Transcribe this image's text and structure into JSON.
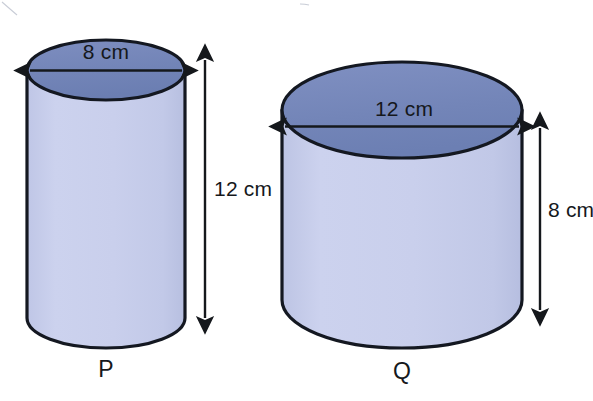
{
  "figure": {
    "background_color": "#ffffff",
    "outline_color": "#141821",
    "top_face_color": "#7385b8",
    "body_color": "#c6ccea",
    "text_color": "#15181c"
  },
  "cylinders": [
    {
      "id": "P",
      "label": "P",
      "diameter_label": "8 cm",
      "diameter_value": 8,
      "height_label": "12 cm",
      "height_value": 12,
      "unit": "cm",
      "height_arrow_side": "right",
      "diameter_arrow_position": "top-face"
    },
    {
      "id": "Q",
      "label": "Q",
      "diameter_label": "12 cm",
      "diameter_value": 12,
      "height_label": "8 cm",
      "height_value": 8,
      "unit": "cm",
      "height_arrow_side": "right",
      "diameter_arrow_position": "top-face"
    }
  ]
}
